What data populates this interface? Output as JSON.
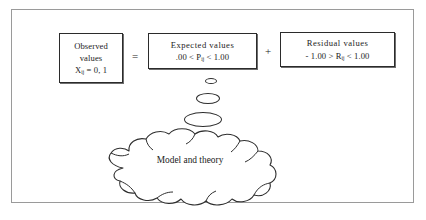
{
  "figure": {
    "name": "observed-expected-residual-decomposition",
    "border_color": "#9a9a9a",
    "background": "#ffffff",
    "ink_color": "#1c1c1c"
  },
  "equation": {
    "boxes": [
      {
        "id": "observed",
        "lines": [
          "Observed",
          "values"
        ],
        "formula_prefix": "X",
        "formula_subscript": "ij",
        "formula_suffix": " = 0, 1"
      },
      {
        "id": "expected",
        "title": "Expected  values",
        "formula_prefix": ".00 < P",
        "formula_subscript": "ij",
        "formula_suffix": " < 1.00"
      },
      {
        "id": "residual",
        "title": "Residual  values",
        "formula_prefix": "- 1.00 > R",
        "formula_subscript": "ij",
        "formula_suffix": " < 1.00"
      }
    ],
    "operators": {
      "equals": "=",
      "plus": "+"
    }
  },
  "thought_bubbles": {
    "count": 3,
    "labels": [
      "small-bubble",
      "medium-bubble",
      "large-bubble"
    ]
  },
  "cloud": {
    "label": "Model and theory"
  }
}
